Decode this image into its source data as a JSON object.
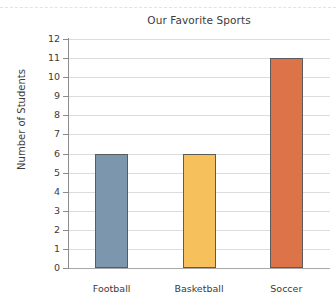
{
  "chart_data": {
    "type": "bar",
    "title": "Our Favorite Sports",
    "xlabel": "",
    "ylabel": "Number of Students",
    "categories": [
      "Football",
      "Basketball",
      "Soccer"
    ],
    "values": [
      6,
      6,
      11
    ],
    "ylim": [
      0,
      12
    ],
    "y_ticks": [
      0,
      1,
      2,
      3,
      4,
      5,
      6,
      7,
      8,
      9,
      10,
      11,
      12
    ],
    "y_tick_labels": [
      "0",
      "1",
      "2",
      "3",
      "4",
      "5",
      "6",
      "7",
      "8",
      "9",
      "10",
      "11",
      "12"
    ],
    "grid": true,
    "grid_axis": "y",
    "legend": false,
    "bar_colors": [
      "#7b96ad",
      "#f6c15c",
      "#dd7449"
    ],
    "bar_edge_color": "#5b5b5b",
    "background_color": "#ffffff",
    "gridline_color": "#dcdcdc",
    "axis_color": "#8c8c8c",
    "text_color": "#3b3b3b"
  }
}
